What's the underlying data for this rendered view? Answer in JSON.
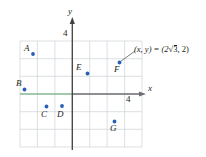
{
  "figure": {
    "type": "cartesian-coordinate-grid",
    "axes": {
      "x_label": "x",
      "y_label": "y",
      "x_tick_label": "4",
      "y_tick_label": "4",
      "x_axis_color_negative": "#5aa469",
      "x_axis_color_positive": "#6d6e71",
      "y_axis_color": "#414042",
      "grid_color": "#c9cdd4",
      "grid_color_alt": "#d9c2c2"
    },
    "points": [
      {
        "label": "A",
        "x": -3,
        "y": 3
      },
      {
        "label": "B",
        "x": -4,
        "y": 0
      },
      {
        "label": "C",
        "x": -2,
        "y": -1
      },
      {
        "label": "D",
        "x": -1,
        "y": -1
      },
      {
        "label": "E",
        "x": 1,
        "y": 1.5
      },
      {
        "label": "F",
        "x": 3.4,
        "y": 2.2
      },
      {
        "label": "G",
        "x": 3,
        "y": -2.4
      }
    ],
    "point_color": "#2b5fb5",
    "callout": {
      "prefix": "(x, y) = (2",
      "radical": "3",
      "suffix": ", 2)",
      "target_point": "F"
    }
  }
}
